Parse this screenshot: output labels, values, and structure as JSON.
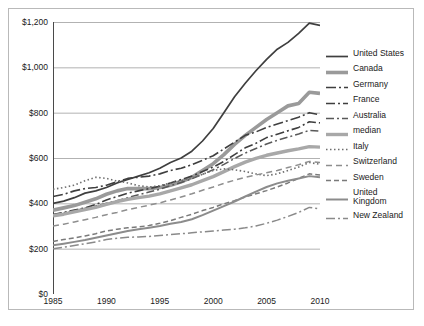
{
  "chart_data": {
    "type": "line",
    "title": "",
    "xlabel": "",
    "ylabel": "",
    "xlim": [
      1985,
      2010
    ],
    "ylim": [
      0,
      1200
    ],
    "grid": true,
    "legend_position": "right",
    "x": [
      1985,
      1986,
      1987,
      1988,
      1989,
      1990,
      1991,
      1992,
      1993,
      1994,
      1995,
      1996,
      1997,
      1998,
      1999,
      2000,
      2001,
      2002,
      2003,
      2004,
      2005,
      2006,
      2007,
      2008,
      2009,
      2010
    ],
    "y_ticks": [
      0,
      200,
      400,
      600,
      800,
      1000,
      1200
    ],
    "y_tick_labels": [
      "$0",
      "$200",
      "$400",
      "$600",
      "$800",
      "$1,000",
      "$1,200"
    ],
    "x_ticks": [
      1985,
      1990,
      1995,
      2000,
      2005,
      2010
    ],
    "x_tick_labels": [
      "1985",
      "1990",
      "1995",
      "2000",
      "2005",
      "2010"
    ],
    "series": [
      {
        "name": "United States",
        "color": "#3f3f3f",
        "width": 1.7,
        "dash": "none",
        "values": [
          400,
          410,
          425,
          445,
          455,
          470,
          490,
          505,
          520,
          535,
          555,
          580,
          600,
          630,
          675,
          730,
          800,
          870,
          930,
          985,
          1035,
          1080,
          1110,
          1150,
          1195,
          1185
        ]
      },
      {
        "name": "Canada",
        "color": "#9a9a9a",
        "width": 3.6,
        "dash": "none",
        "values": [
          370,
          380,
          390,
          405,
          420,
          440,
          455,
          465,
          465,
          465,
          470,
          480,
          495,
          515,
          545,
          575,
          615,
          660,
          700,
          735,
          770,
          800,
          830,
          840,
          890,
          885
        ]
      },
      {
        "name": "Germany",
        "color": "#3f3f3f",
        "width": 1.6,
        "dash": "10,3,2,3",
        "values": [
          430,
          440,
          455,
          465,
          470,
          480,
          495,
          510,
          515,
          520,
          530,
          545,
          555,
          570,
          590,
          610,
          640,
          670,
          700,
          715,
          735,
          750,
          765,
          780,
          800,
          790
        ]
      },
      {
        "name": "France",
        "color": "#3f3f3f",
        "width": 1.6,
        "dash": "9,3,2,3",
        "values": [
          350,
          360,
          370,
          380,
          395,
          415,
          430,
          445,
          455,
          465,
          475,
          490,
          505,
          520,
          540,
          560,
          585,
          615,
          645,
          665,
          690,
          705,
          720,
          735,
          760,
          755
        ]
      },
      {
        "name": "Australia",
        "color": "#585858",
        "width": 1.5,
        "dash": "8,3,2,3",
        "values": [
          350,
          358,
          368,
          378,
          388,
          400,
          412,
          425,
          438,
          450,
          462,
          478,
          492,
          508,
          528,
          548,
          572,
          598,
          622,
          642,
          662,
          678,
          692,
          706,
          722,
          718
        ]
      },
      {
        "name": "median",
        "color": "#a8a8a8",
        "width": 3.4,
        "dash": "none",
        "values": [
          345,
          352,
          362,
          372,
          382,
          395,
          408,
          418,
          425,
          432,
          442,
          455,
          468,
          482,
          500,
          518,
          540,
          562,
          582,
          598,
          612,
          622,
          632,
          640,
          650,
          648
        ]
      },
      {
        "name": "Italy",
        "color": "#6e6e6e",
        "width": 1.6,
        "dash": "1.5,2.5",
        "values": [
          462,
          470,
          480,
          500,
          515,
          510,
          498,
          490,
          478,
          472,
          478,
          490,
          500,
          512,
          528,
          545,
          552,
          548,
          540,
          530,
          522,
          530,
          545,
          560,
          580,
          572
        ]
      },
      {
        "name": "Switzerland",
        "color": "#8e8e8e",
        "width": 1.5,
        "dash": "6,4",
        "values": [
          300,
          308,
          318,
          328,
          338,
          350,
          360,
          372,
          382,
          392,
          402,
          415,
          428,
          442,
          458,
          472,
          488,
          502,
          515,
          525,
          535,
          545,
          558,
          570,
          585,
          580
        ]
      },
      {
        "name": "Sweden",
        "color": "#7a7a7a",
        "width": 1.5,
        "dash": "5,3",
        "values": [
          232,
          240,
          248,
          256,
          266,
          278,
          286,
          292,
          296,
          302,
          312,
          324,
          338,
          352,
          368,
          382,
          398,
          412,
          428,
          442,
          456,
          472,
          490,
          510,
          530,
          525
        ]
      },
      {
        "name": "United Kingdom",
        "color": "#8c8c8c",
        "width": 2.0,
        "dash": "none",
        "values": [
          215,
          222,
          230,
          238,
          248,
          258,
          268,
          278,
          286,
          292,
          300,
          310,
          318,
          330,
          348,
          368,
          388,
          408,
          430,
          452,
          472,
          488,
          500,
          510,
          520,
          515
        ]
      },
      {
        "name": "New Zealand",
        "color": "#8a8a8a",
        "width": 1.5,
        "dash": "9,3,2,3",
        "values": [
          200,
          206,
          214,
          222,
          230,
          240,
          246,
          250,
          252,
          254,
          258,
          262,
          266,
          270,
          274,
          278,
          282,
          286,
          292,
          300,
          312,
          326,
          342,
          360,
          382,
          375
        ]
      }
    ]
  },
  "legend": {
    "items": [
      {
        "label": "United States",
        "swatch": "solid-dark-thin"
      },
      {
        "label": "Canada",
        "swatch": "solid-gray-thick"
      },
      {
        "label": "Germany",
        "swatch": "dash-dot-dot-dark"
      },
      {
        "label": "France",
        "swatch": "dash-dot-dark"
      },
      {
        "label": "Australia",
        "swatch": "dash-dot-gray"
      },
      {
        "label": "median",
        "swatch": "solid-lightgray-thick"
      },
      {
        "label": "Italy",
        "swatch": "dotted-gray"
      },
      {
        "label": "Switzerland",
        "swatch": "dashed-long-gray"
      },
      {
        "label": "Sweden",
        "swatch": "dashed-short-gray"
      },
      {
        "label": "United\nKingdom",
        "swatch": "solid-gray-medium"
      },
      {
        "label": "New Zealand",
        "swatch": "dash-dot-gray2"
      }
    ]
  },
  "caption": {
    "text": ""
  },
  "colors": {
    "axis": "#4a4a4a",
    "grid": "#9e9e9e",
    "frame": "#b9b9b9",
    "text": "#1a1a1a",
    "background": "#ffffff"
  }
}
